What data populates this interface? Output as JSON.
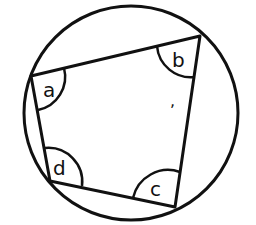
{
  "diagram": {
    "circle": {
      "cx": 131,
      "cy": 113,
      "r": 107
    },
    "vertices": {
      "a": {
        "x": 31,
        "y": 76
      },
      "b": {
        "x": 200,
        "y": 36
      },
      "c": {
        "x": 175,
        "y": 207
      },
      "d": {
        "x": 50,
        "y": 181
      }
    },
    "angle_labels": {
      "a": "a",
      "b": "b",
      "c": "c",
      "d": "d"
    },
    "center_mark": ",",
    "stroke_color": "#111111",
    "background": "#ffffff"
  }
}
